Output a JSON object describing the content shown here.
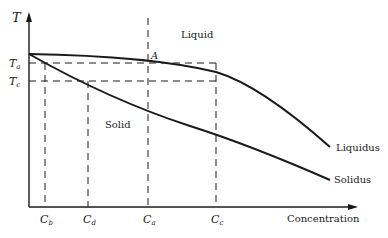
{
  "diagram": {
    "type": "phase-diagram",
    "axes": {
      "y_label": "T",
      "x_label": "Concentration"
    },
    "temperature_ticks": [
      {
        "main": "T",
        "sub": "a"
      },
      {
        "main": "T",
        "sub": "c"
      }
    ],
    "concentration_ticks": [
      {
        "main": "C",
        "sub": "b"
      },
      {
        "main": "C",
        "sub": "d"
      },
      {
        "main": "C",
        "sub": "a"
      },
      {
        "main": "C",
        "sub": "c"
      }
    ],
    "regions": {
      "liquid": "Liquid",
      "solid": "Solid"
    },
    "curves": {
      "liquidus": "Liquidus",
      "solidus": "Solidus"
    },
    "point_label": "A",
    "colors": {
      "line": "#1a1a1a",
      "background": "#ffffff"
    }
  }
}
